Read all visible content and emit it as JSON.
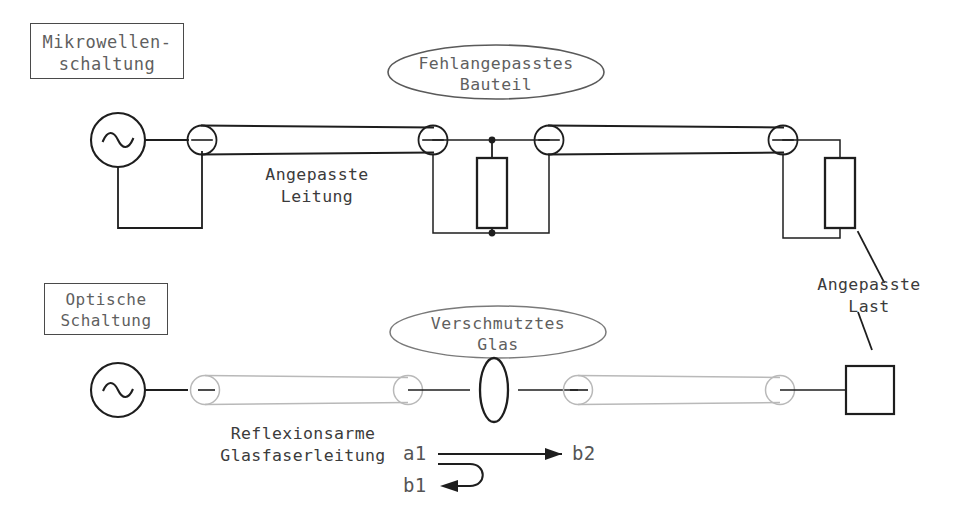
{
  "figure": {
    "title_microwave": "Mikrowellen-\nschaltung",
    "title_optical": "Optische\nSchaltung"
  },
  "labels": {
    "microwave_box": "Mikrowellen-\nschaltung",
    "optical_box": "Optische\nSchaltung",
    "mismatched_part": "Fehlangepasstes\nBauteil",
    "dirty_glass": "Verschmutztes\nGlas",
    "matched_line": "Angepasste\nLeitung",
    "matched_load": "Angepasste\nLast",
    "low_reflection_fiber": "Reflexionsarme\nGlasfaserleitung"
  },
  "ports": {
    "a1": "a1",
    "b1": "b1",
    "b2": "b2"
  },
  "icons": {
    "ac_source_microwave": "ac-source-icon",
    "ac_source_optical": "ac-source-icon",
    "shunt_resistor": "resistor-icon",
    "load_resistor": "resistor-icon",
    "detector_square": "detector-icon",
    "glass_lens": "lens-icon",
    "arrow_forward": "arrow-right-icon",
    "arrow_reflected": "arrow-left-icon"
  },
  "colors": {
    "ink": "#1e1e1e",
    "fiber_gray": "#b9b9b9",
    "label_text": "#5f5f5f",
    "label_border": "#4a4a4a",
    "ellipse_border": "#5a5a5a",
    "circuit_text": "#3b3b3b"
  },
  "geometry": {
    "width": 953,
    "height": 527
  }
}
